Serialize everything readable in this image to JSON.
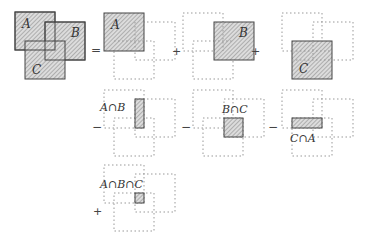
{
  "colors": {
    "stroke": "#444444",
    "fill": "#d6d6d6",
    "hatch": "#8a8a8a",
    "dotted": "#8a8a8a"
  },
  "sets": [
    "A",
    "B",
    "C"
  ],
  "operators": {
    "equals": "=",
    "plus": "+",
    "minus": "−"
  },
  "terms": [
    {
      "sign": "=",
      "label": "A",
      "kind": "set"
    },
    {
      "sign": "+",
      "label": "B",
      "kind": "set"
    },
    {
      "sign": "+",
      "label": "C",
      "kind": "set"
    },
    {
      "sign": "−",
      "label": "A∩B",
      "kind": "intersection"
    },
    {
      "sign": "−",
      "label": "B∩C",
      "kind": "intersection"
    },
    {
      "sign": "−",
      "label": "C∩A",
      "kind": "intersection"
    },
    {
      "sign": "+",
      "label": "A∩B∩C",
      "kind": "intersection"
    }
  ],
  "labels": {
    "A": "A",
    "B": "B",
    "C": "C",
    "AB": "A∩B",
    "BC": "B∩C",
    "CA": "C∩A",
    "ABC": "A∩B∩C"
  }
}
